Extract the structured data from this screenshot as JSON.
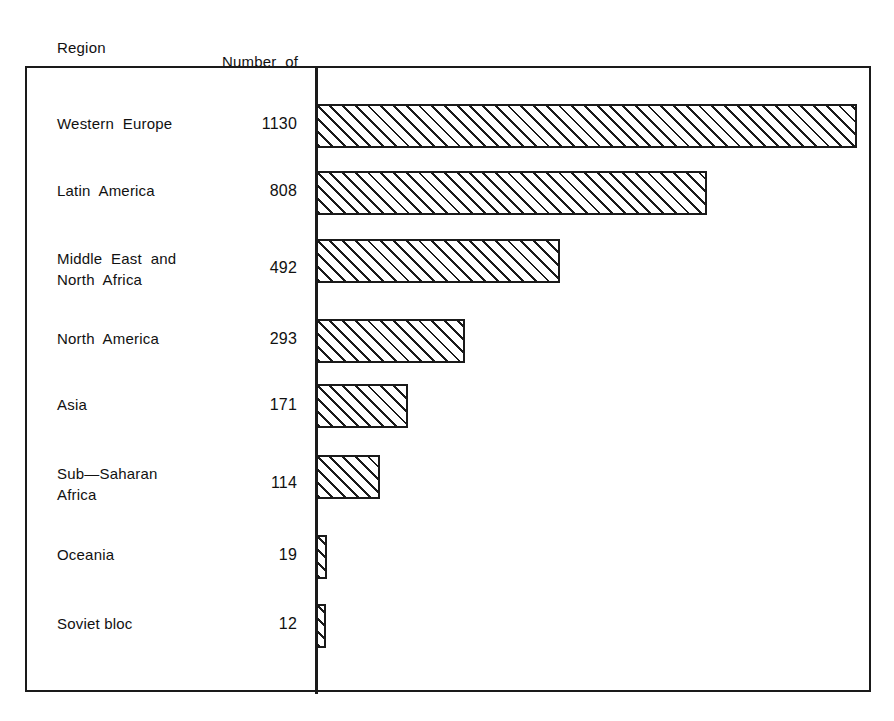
{
  "figure": {
    "headers": {
      "region": "Region",
      "number_line1": "Number  of",
      "number_line2": "attacks"
    }
  },
  "chart_data": {
    "type": "bar",
    "orientation": "horizontal",
    "title": "",
    "xlabel": "",
    "ylabel": "Region",
    "value_label": "Number of attacks",
    "categories": [
      "Western  Europe",
      "Latin  America",
      "Middle  East  and\nNorth  Africa",
      "North  America",
      "Asia",
      "Sub—Saharan\nAfrica",
      "Oceania",
      "Soviet bloc"
    ],
    "values": [
      1130,
      808,
      492,
      293,
      171,
      114,
      19,
      12
    ],
    "value_labels": [
      "1130",
      "808",
      "492",
      "293",
      "171",
      "114",
      "19",
      "12"
    ],
    "xlim": [
      0,
      1130
    ],
    "grid": false,
    "legend": null,
    "bar_fill": "diagonal-hatch",
    "bar_color": "#1a1a1a",
    "background": "#ffffff"
  },
  "rows": [
    {
      "label": "Western  Europe",
      "value": "1130",
      "label_top": 113,
      "value_top": 113,
      "bar_top": 104,
      "bar_width": 541
    },
    {
      "label": "Latin  America",
      "value": "808",
      "label_top": 180,
      "value_top": 180,
      "bar_top": 171,
      "bar_width": 391
    },
    {
      "label": "Middle  East  and",
      "label2": "North  Africa",
      "value": "492",
      "label_top": 248,
      "value_top": 257,
      "bar_top": 239,
      "bar_width": 244
    },
    {
      "label": "North  America",
      "value": "293",
      "label_top": 328,
      "value_top": 328,
      "bar_top": 319,
      "bar_width": 149
    },
    {
      "label": "Asia",
      "value": "171",
      "label_top": 394,
      "value_top": 394,
      "bar_top": 384,
      "bar_width": 92
    },
    {
      "label": "Sub—Saharan",
      "label2": "Africa",
      "value": "114",
      "label_top": 463,
      "value_top": 472,
      "bar_top": 455,
      "bar_width": 64
    },
    {
      "label": "Oceania",
      "value": "19",
      "label_top": 544,
      "value_top": 544,
      "bar_top": 535,
      "bar_width": 11
    },
    {
      "label": "Soviet bloc",
      "value": "12",
      "label_top": 613,
      "value_top": 613,
      "bar_top": 604,
      "bar_width": 10
    }
  ]
}
